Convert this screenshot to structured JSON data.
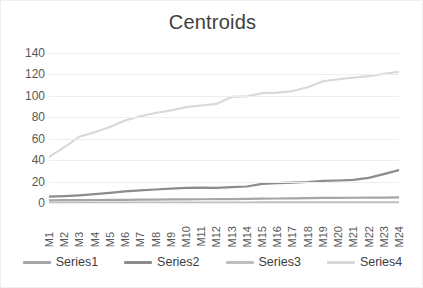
{
  "chart_data": {
    "type": "line",
    "title": "Centroids",
    "xlabel": "",
    "ylabel": "",
    "ylim": [
      0,
      140
    ],
    "yticks": [
      0,
      20,
      40,
      60,
      80,
      100,
      120,
      140
    ],
    "grid": true,
    "legend_position": "bottom",
    "categories": [
      "M1",
      "M2",
      "M3",
      "M4",
      "M5",
      "M6",
      "M7",
      "M8",
      "M9",
      "M10",
      "M11",
      "M12",
      "M13",
      "M14",
      "M15",
      "M16",
      "M17",
      "M18",
      "M19",
      "M20",
      "M21",
      "M22",
      "M23",
      "M24"
    ],
    "series": [
      {
        "name": "Series1",
        "color": "#a6a6a6",
        "values": [
          2.5,
          2.6,
          2.7,
          2.8,
          2.9,
          3.0,
          3.1,
          3.2,
          3.3,
          3.4,
          3.5,
          3.6,
          3.7,
          3.8,
          4.0,
          4.2,
          4.4,
          4.6,
          4.7,
          4.8,
          4.9,
          5.0,
          5.1,
          5.2
        ]
      },
      {
        "name": "Series2",
        "color": "#8c8c8c",
        "values": [
          6.0,
          6.5,
          7.2,
          8.2,
          9.5,
          10.8,
          11.8,
          12.6,
          13.4,
          14.2,
          14.4,
          14.2,
          14.8,
          15.4,
          17.8,
          18.6,
          19.0,
          19.6,
          20.6,
          21.0,
          21.6,
          23.4,
          27.0,
          30.8
        ]
      },
      {
        "name": "Series3",
        "color": "#bfbfbf",
        "values": [
          0.4,
          0.4,
          0.4,
          0.4,
          0.4,
          0.4,
          0.4,
          0.4,
          0.4,
          0.4,
          0.4,
          0.4,
          0.4,
          0.4,
          0.5,
          0.5,
          0.5,
          0.5,
          0.5,
          0.5,
          0.5,
          0.6,
          0.6,
          0.6
        ]
      },
      {
        "name": "Series4",
        "color": "#d9d9d9",
        "values": [
          43.0,
          52.0,
          62.0,
          66.0,
          71.0,
          77.0,
          81.0,
          84.0,
          86.5,
          89.5,
          91.0,
          92.5,
          99.0,
          99.5,
          102.5,
          103.0,
          104.5,
          108.0,
          113.5,
          115.5,
          117.0,
          118.5,
          120.5,
          122.5
        ]
      }
    ]
  }
}
